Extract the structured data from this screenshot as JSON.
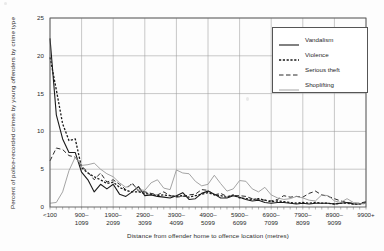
{
  "chart_data": {
    "type": "line",
    "title": "",
    "xlabel": "Distance from offender home to offence location (metres)",
    "ylabel": "Percent of police-recorded crimes by young offenders by crime type",
    "ylim": [
      0,
      25
    ],
    "yticks": [
      0,
      5,
      10,
      15,
      20,
      25
    ],
    "grid": true,
    "legend_position": "top-right",
    "xtick_labels": [
      "<100",
      "900–\n1099",
      "1900–\n2099",
      "2900–\n3099",
      "3900–\n4099",
      "4900–\n5099",
      "5900–\n6099",
      "6900–\n7099",
      "7900–\n8099",
      "8900–\n9099",
      "9900+"
    ],
    "xtick_indices": [
      0,
      5,
      10,
      15,
      20,
      25,
      30,
      35,
      40,
      45,
      50
    ],
    "x_count": 51,
    "series": [
      {
        "name": "Vandalism",
        "color": "#1a1a1a",
        "dash": "none",
        "width": 1.1,
        "values": [
          22.3,
          12.2,
          9.0,
          7.2,
          7.2,
          4.6,
          3.6,
          2.0,
          3.0,
          2.4,
          3.0,
          1.7,
          1.4,
          2.0,
          2.7,
          1.5,
          1.6,
          1.4,
          1.3,
          1.2,
          1.5,
          1.9,
          1.0,
          1.1,
          1.8,
          2.1,
          1.7,
          1.2,
          1.2,
          1.5,
          1.3,
          1.0,
          0.8,
          0.9,
          0.6,
          0.5,
          0.6,
          0.6,
          0.5,
          0.4,
          0.5,
          0.4,
          0.5,
          0.5,
          0.5,
          0.4,
          0.5,
          0.6,
          0.4,
          0.4,
          0.6
        ]
      },
      {
        "name": "Violence",
        "color": "#1a1a1a",
        "dash": "2.2,1.6",
        "width": 1.3,
        "values": [
          19.8,
          15.5,
          11.0,
          8.8,
          9.0,
          5.2,
          4.5,
          4.0,
          3.6,
          3.1,
          3.3,
          2.6,
          2.2,
          2.0,
          2.0,
          1.8,
          1.7,
          1.5,
          1.6,
          1.5,
          1.4,
          1.5,
          1.3,
          1.5,
          1.7,
          1.9,
          1.6,
          1.5,
          1.3,
          1.6,
          1.2,
          1.1,
          1.0,
          1.1,
          0.9,
          0.7,
          0.8,
          0.7,
          0.6,
          0.5,
          0.6,
          0.5,
          0.6,
          0.5,
          0.5,
          0.4,
          0.5,
          0.5,
          0.4,
          0.4,
          0.5
        ]
      },
      {
        "name": "Serious theft",
        "color": "#2b2b2b",
        "dash": "4.5,2.5",
        "width": 1.0,
        "values": [
          6.1,
          7.8,
          7.6,
          6.8,
          6.6,
          5.4,
          4.6,
          3.6,
          4.5,
          3.3,
          3.6,
          3.0,
          2.3,
          3.2,
          2.1,
          2.0,
          1.8,
          1.6,
          2.0,
          1.5,
          1.3,
          1.4,
          1.6,
          1.7,
          2.3,
          2.2,
          1.6,
          1.8,
          1.4,
          1.5,
          1.5,
          1.4,
          1.1,
          1.0,
          0.9,
          0.8,
          1.0,
          1.5,
          1.3,
          1.4,
          1.3,
          1.8,
          2.1,
          1.6,
          1.4,
          1.1,
          0.8,
          0.6,
          0.5,
          0.5,
          0.7
        ]
      },
      {
        "name": "Shoplifting",
        "color": "#9a9a9a",
        "dash": "none",
        "width": 0.9,
        "values": [
          0.5,
          0.6,
          2.0,
          4.8,
          6.6,
          5.5,
          5.6,
          5.8,
          5.0,
          4.4,
          4.0,
          3.2,
          2.6,
          3.0,
          2.3,
          2.2,
          3.2,
          3.6,
          2.5,
          2.3,
          4.9,
          4.5,
          4.4,
          3.4,
          2.8,
          3.0,
          4.2,
          3.1,
          2.1,
          2.4,
          3.5,
          3.4,
          2.4,
          2.0,
          2.6,
          1.6,
          1.2,
          1.0,
          1.1,
          1.4,
          1.2,
          0.9,
          0.8,
          1.6,
          1.5,
          0.8,
          0.6,
          1.1,
          0.6,
          0.4,
          0.5
        ]
      }
    ]
  },
  "legend": {
    "entries": [
      {
        "label": "Vandalism"
      },
      {
        "label": "Violence"
      },
      {
        "label": "Serious theft"
      },
      {
        "label": "Shoplifting"
      }
    ]
  }
}
